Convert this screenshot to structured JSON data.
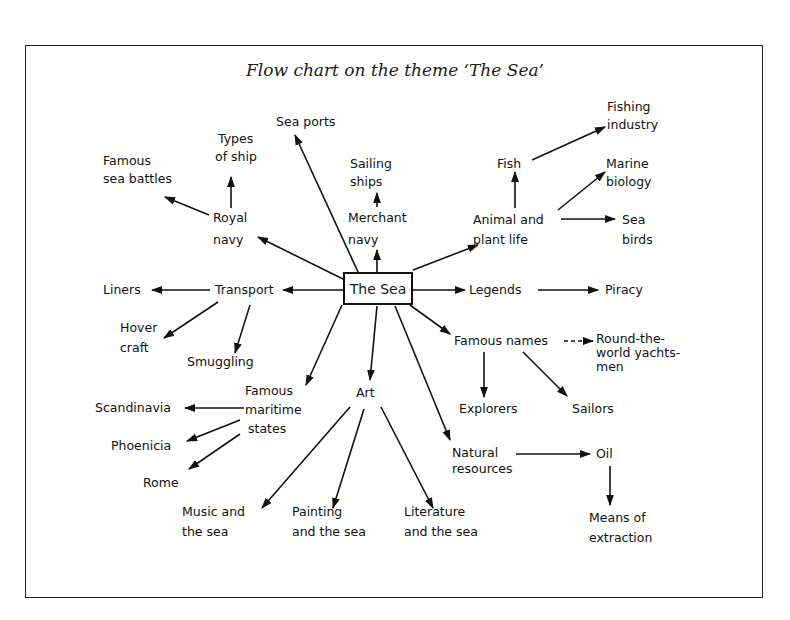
{
  "header_fragment": "— —",
  "title": "Flow chart on the theme ‘The Sea’",
  "center": {
    "label": "The Sea"
  },
  "nodes": {
    "sea_ports": "Sea ports",
    "types_of_ship": [
      "Types",
      "of ship"
    ],
    "famous_sea_battles": [
      "Famous",
      "sea battles"
    ],
    "royal_navy": [
      "Royal",
      "navy"
    ],
    "sailing_ships": [
      "Sailing",
      "ships"
    ],
    "merchant_navy": [
      "Merchant",
      "navy"
    ],
    "fishing_industry": [
      "Fishing",
      "industry"
    ],
    "fish": "Fish",
    "marine_biology": [
      "Marine",
      "biology"
    ],
    "animal_plant_life": [
      "Animal and",
      "plant life"
    ],
    "sea_birds": [
      "Sea",
      "birds"
    ],
    "liners": "Liners",
    "transport": "Transport",
    "hover_craft": [
      "Hover",
      "craft"
    ],
    "smuggling": "Smuggling",
    "legends": "Legends",
    "piracy": "Piracy",
    "famous_names": "Famous names",
    "round_the_world": [
      "Round-the-",
      "world yachts-",
      "men"
    ],
    "explorers": "Explorers",
    "sailors": "Sailors",
    "famous_maritime_states": [
      "Famous",
      "maritime",
      "states"
    ],
    "scandinavia": "Scandinavia",
    "phoenicia": "Phoenicia",
    "rome": "Rome",
    "art": "Art",
    "music_and_the_sea": [
      "Music and",
      "the sea"
    ],
    "painting_and_the_sea": [
      "Painting",
      "and the sea"
    ],
    "literature_and_the_sea": [
      "Literature",
      "and the sea"
    ],
    "natural_resources": [
      "Natural",
      "resources"
    ],
    "oil": "Oil",
    "means_of_extraction": [
      "Means of",
      "extraction"
    ]
  },
  "edges": [
    [
      "The Sea",
      "Sea ports"
    ],
    [
      "The Sea",
      "Royal navy"
    ],
    [
      "The Sea",
      "Merchant navy"
    ],
    [
      "The Sea",
      "Animal and plant life"
    ],
    [
      "The Sea",
      "Transport"
    ],
    [
      "The Sea",
      "Legends"
    ],
    [
      "The Sea",
      "Famous names"
    ],
    [
      "The Sea",
      "Famous maritime states"
    ],
    [
      "The Sea",
      "Art"
    ],
    [
      "The Sea",
      "Natural resources"
    ],
    [
      "Royal navy",
      "Types of ship"
    ],
    [
      "Royal navy",
      "Famous sea battles"
    ],
    [
      "Merchant navy",
      "Sailing ships"
    ],
    [
      "Animal and plant life",
      "Fish"
    ],
    [
      "Fish",
      "Fishing industry"
    ],
    [
      "Animal and plant life",
      "Marine biology"
    ],
    [
      "Animal and plant life",
      "Sea birds"
    ],
    [
      "Transport",
      "Liners"
    ],
    [
      "Transport",
      "Hover craft"
    ],
    [
      "Transport",
      "Smuggling"
    ],
    [
      "Legends",
      "Piracy"
    ],
    [
      "Famous names",
      "Round-the-world yachtsmen"
    ],
    [
      "Famous names",
      "Explorers"
    ],
    [
      "Famous names",
      "Sailors"
    ],
    [
      "Famous maritime states",
      "Scandinavia"
    ],
    [
      "Famous maritime states",
      "Phoenicia"
    ],
    [
      "Famous maritime states",
      "Rome"
    ],
    [
      "Art",
      "Music and the sea"
    ],
    [
      "Art",
      "Painting and the sea"
    ],
    [
      "Art",
      "Literature and the sea"
    ],
    [
      "Natural resources",
      "Oil"
    ],
    [
      "Oil",
      "Means of extraction"
    ]
  ],
  "colors": {
    "ink": "#111111",
    "paper": "#ffffff"
  }
}
